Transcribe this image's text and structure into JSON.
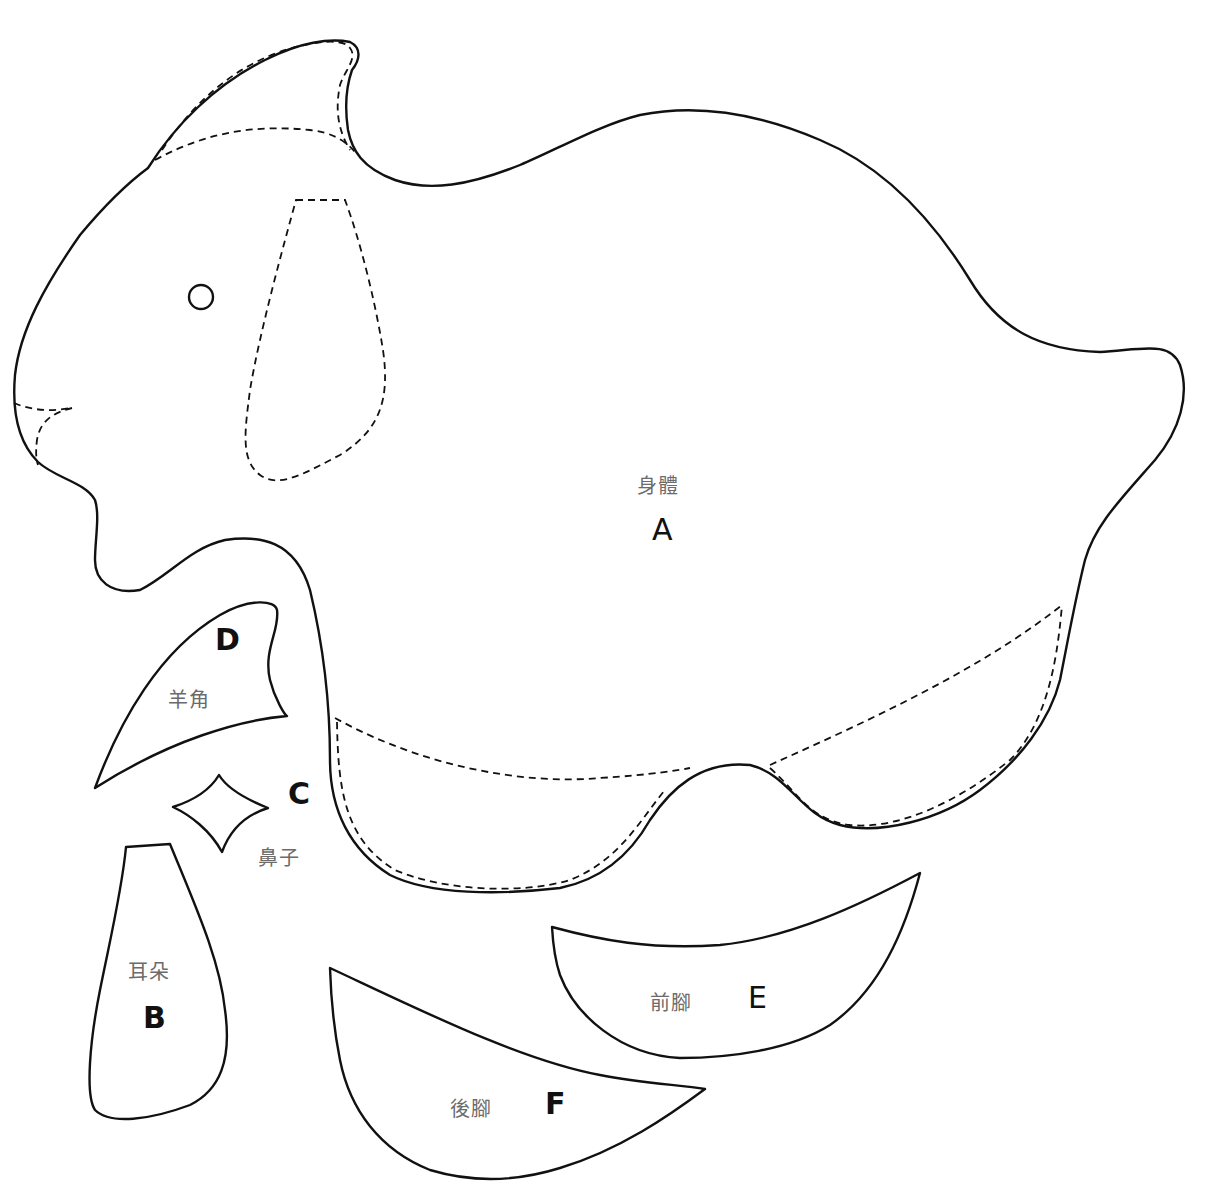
{
  "diagram": {
    "type": "sewing-pattern",
    "stroke_color": "#111111",
    "label_color": "#6b6b6b",
    "background": "#ffffff"
  },
  "pieces": [
    {
      "id": "A",
      "name_cn": "身體",
      "letter": "A"
    },
    {
      "id": "B",
      "name_cn": "耳朵",
      "letter": "B"
    },
    {
      "id": "C",
      "name_cn": "鼻子",
      "letter": "C"
    },
    {
      "id": "D",
      "name_cn": "羊角",
      "letter": "D"
    },
    {
      "id": "E",
      "name_cn": "前腳",
      "letter": "E"
    },
    {
      "id": "F",
      "name_cn": "後腳",
      "letter": "F"
    }
  ]
}
